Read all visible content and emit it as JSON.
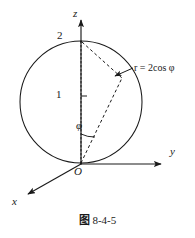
{
  "figure": {
    "caption_label": "图",
    "caption_number": "8-4-5",
    "caption_full": "图 8-4-5",
    "stroke_color": "#1a1a1a",
    "background_color": "#ffffff"
  },
  "axes": {
    "z": {
      "label": "z",
      "direction": "up",
      "origin_px": [
        81,
        164
      ],
      "tip_px": [
        81,
        16
      ]
    },
    "y": {
      "label": "y",
      "direction": "right",
      "origin_px": [
        81,
        164
      ],
      "tip_px": [
        166,
        164
      ]
    },
    "x": {
      "label": "x",
      "direction": "down-left",
      "origin_px": [
        81,
        164
      ],
      "tip_px": [
        24,
        196
      ]
    },
    "origin_label": "O"
  },
  "circle": {
    "center_px": [
      81,
      102
    ],
    "radius_px": 61,
    "note": "great-circle outline of the sphere"
  },
  "marks": {
    "top_value": "2",
    "center_value": "1",
    "angle_symbol": "φ"
  },
  "annotation": {
    "equation_text": "r = 2cos φ",
    "equation_lhs": "r",
    "equation_rhs": "2cos φ",
    "points_to_px": [
      113,
      77
    ]
  },
  "points": {
    "top_px": [
      81,
      41
    ],
    "surface_point_px": [
      122,
      78
    ],
    "origin_px": [
      81,
      164
    ]
  }
}
